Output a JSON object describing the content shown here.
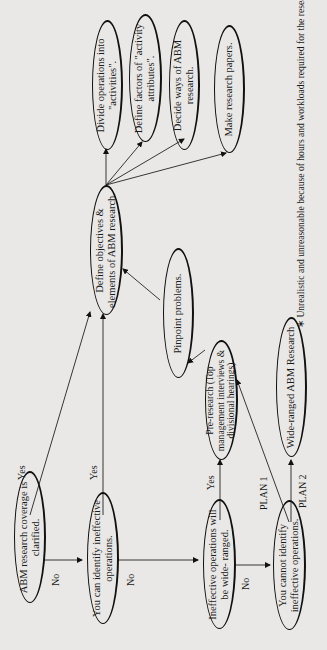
{
  "diagram": {
    "nodes": {
      "coverage": "ABM research coverage is clarified.",
      "can_identify": "You can identify ineffective operations.",
      "wide_ranged": "Ineffective operations will be wide- ranged.",
      "cannot_identify": "You cannot identify ineffective operations.",
      "pre_research": "Pre-research (Top management interviews & divisional hearings)",
      "wide_abm": "Wide-ranged ABM Research",
      "pinpoint": "Pinpoint problems.",
      "define_objectives": "Define objectives & elements of ABM research.",
      "divide_ops": "Divide operations into \"activities\".",
      "define_factors": "Define factors of \"activity attributes\".",
      "decide_ways": "Decide ways of ABM research.",
      "make_papers": "Make research papers."
    },
    "edge_labels": {
      "yes1": "Yes",
      "yes2": "Yes",
      "yes3": "Yes",
      "no1": "No",
      "no2": "No",
      "no3": "No",
      "plan1": "PLAN 1",
      "plan2": "PLAN 2"
    },
    "footnote": "∗ Unrealistic and unreasonable because of hours and workloads required for the research."
  }
}
